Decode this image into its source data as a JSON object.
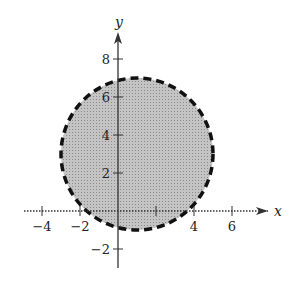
{
  "graph": {
    "x_axis_label": "x",
    "y_axis_label": "y",
    "x_ticks": [
      {
        "v": -4,
        "label": "−4"
      },
      {
        "v": -2,
        "label": "−2"
      },
      {
        "v": 2,
        "label": ""
      },
      {
        "v": 4,
        "label": "4"
      },
      {
        "v": 6,
        "label": "6"
      }
    ],
    "y_ticks": [
      {
        "v": 8,
        "label": "8"
      },
      {
        "v": 6,
        "label": "6"
      },
      {
        "v": 4,
        "label": "4"
      },
      {
        "v": 2,
        "label": "2"
      },
      {
        "v": -2,
        "label": "−2"
      }
    ],
    "region": {
      "center_x": 1,
      "center_y": 3,
      "radius": 4,
      "boundary": "dashed",
      "fill": "#b8b8b8"
    },
    "inequality": "(x-1)^2 + (y-3)^2 < 16"
  }
}
